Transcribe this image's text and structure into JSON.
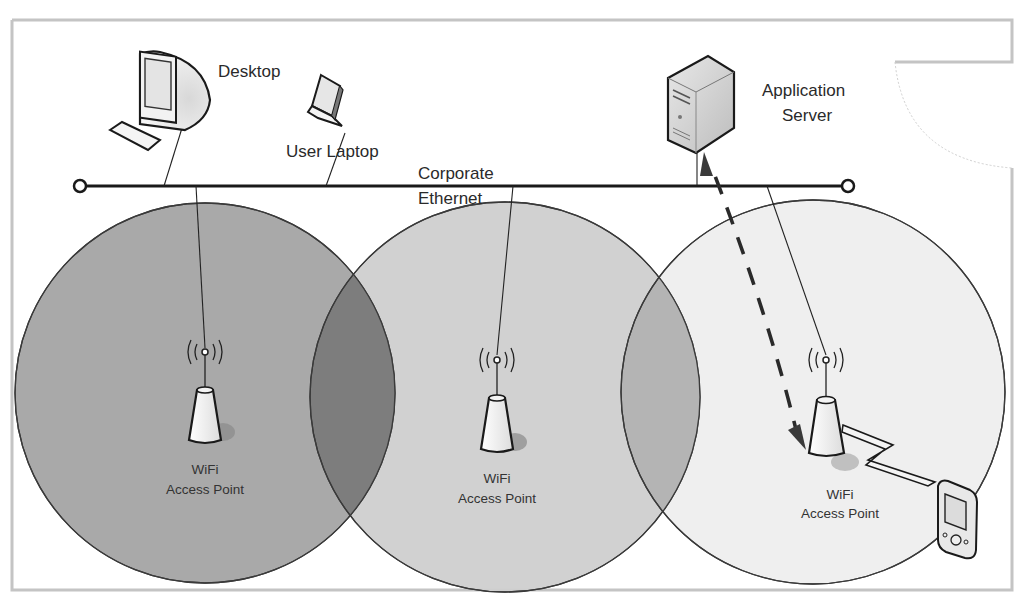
{
  "diagram": {
    "type": "wireless-network-topology",
    "network": {
      "label_line1": "Corporate",
      "label_line2": "Ethernet"
    },
    "wired_devices": [
      {
        "id": "desktop",
        "label": "Desktop",
        "icon": "desktop-computer-icon"
      },
      {
        "id": "laptop",
        "label": "User Laptop",
        "icon": "laptop-icon"
      },
      {
        "id": "server",
        "label_line1": "Application",
        "label_line2": "Server",
        "icon": "server-tower-icon"
      }
    ],
    "access_points": [
      {
        "id": "ap1",
        "label_line1": "WiFi",
        "label_line2": "Access Point",
        "coverage_shade": "#a8a8a8"
      },
      {
        "id": "ap2",
        "label_line1": "WiFi",
        "label_line2": "Access Point",
        "coverage_shade": "#cfcfcf"
      },
      {
        "id": "ap3",
        "label_line1": "WiFi",
        "label_line2": "Access Point",
        "coverage_shade": "#efefef"
      }
    ],
    "wireless_client": {
      "id": "pda",
      "icon": "handheld-pda-icon"
    },
    "connections": [
      {
        "from": "desktop",
        "to": "ethernet",
        "style": "solid"
      },
      {
        "from": "laptop",
        "to": "ethernet",
        "style": "solid"
      },
      {
        "from": "server",
        "to": "ethernet",
        "style": "solid"
      },
      {
        "from": "ap1",
        "to": "ethernet",
        "style": "solid"
      },
      {
        "from": "ap2",
        "to": "ethernet",
        "style": "solid"
      },
      {
        "from": "ap3",
        "to": "ethernet",
        "style": "solid"
      },
      {
        "from": "pda",
        "to": "ap3",
        "style": "wireless-lightning"
      },
      {
        "from": "ap3",
        "to": "server",
        "style": "dashed-arrow"
      }
    ],
    "colors": {
      "line": "#1a1a1a",
      "overlap_dark": "#7a7a7a",
      "frame": "#c8c8c8"
    }
  }
}
